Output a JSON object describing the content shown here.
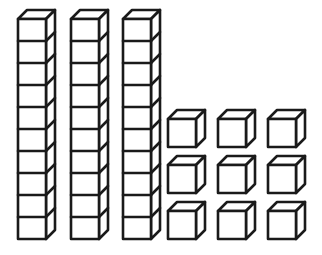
{
  "figure": {
    "background_color": "#ffffff",
    "stroke_color": "#1a1a1a",
    "face_fill_color": "#ffffff",
    "stroke_width": 2.6
  },
  "chart_data": {
    "type": "diagram",
    "representation": "base-ten place value blocks",
    "total_value": 39,
    "categories": [
      "tens",
      "ones"
    ],
    "values": [
      30,
      9
    ],
    "groups": [
      {
        "name": "tens",
        "label": "Tens rods",
        "block_type": "rod",
        "count": 3,
        "units_per_block": 10,
        "value_per_block": 10,
        "subtotal": 30
      },
      {
        "name": "ones",
        "label": "Unit cubes",
        "block_type": "cube",
        "count": 9,
        "units_per_block": 1,
        "value_per_block": 1,
        "subtotal": 9,
        "arrangement": "3 rows by 3 columns"
      }
    ]
  },
  "geometry": {
    "rod": {
      "count": 3,
      "segments": 10,
      "face_width": 28,
      "segment_height": 22,
      "depth_x": 9,
      "depth_y": 9,
      "origins_x": [
        18,
        71,
        123
      ],
      "origin_y": 19
    },
    "cube": {
      "count": 9,
      "face_width": 28,
      "face_height": 28,
      "depth_x": 9,
      "depth_y": 9,
      "columns_x": [
        168,
        218,
        268
      ],
      "rows_y": [
        119,
        165,
        211
      ]
    }
  }
}
